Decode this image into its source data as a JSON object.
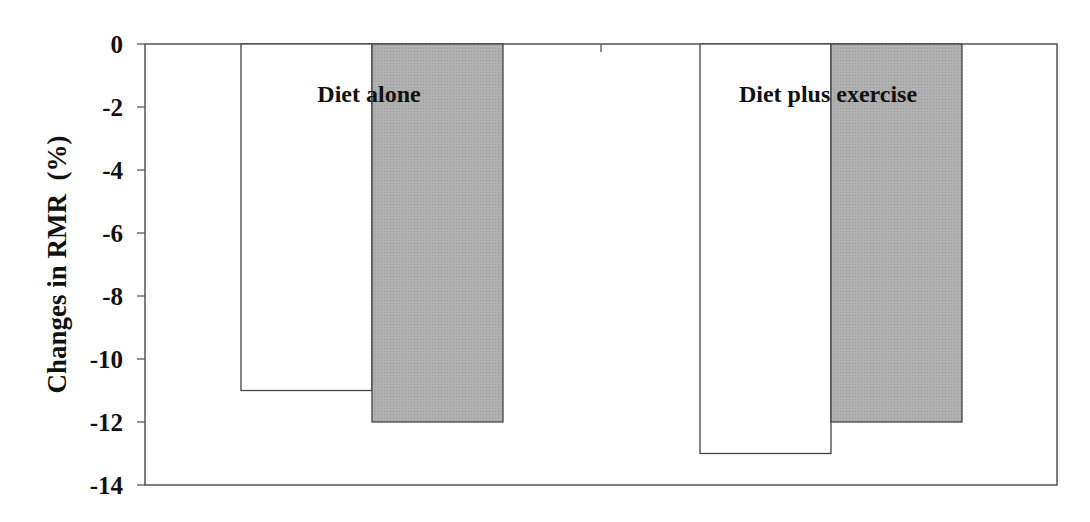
{
  "chart_data": {
    "type": "bar",
    "title": "",
    "xlabel": "",
    "ylabel": "Changes in RMR  (%)",
    "ylim": [
      -14,
      0
    ],
    "yticks": [
      0,
      -2,
      -4,
      -6,
      -8,
      -10,
      -12,
      -14
    ],
    "grid": false,
    "legend": null,
    "categories": [
      "Diet alone",
      "Diet plus exercise"
    ],
    "series": [
      {
        "name": "Series 1 (white)",
        "color": "#ffffff",
        "values": [
          -11,
          -13
        ]
      },
      {
        "name": "Series 2 (gray)",
        "color": "#b0b0b0",
        "values": [
          -12,
          -12
        ]
      }
    ]
  },
  "colors": {
    "axis": "#555555",
    "bar_outline": "#444444",
    "gray_fill": "#b0b0b0",
    "white_fill": "#ffffff"
  }
}
